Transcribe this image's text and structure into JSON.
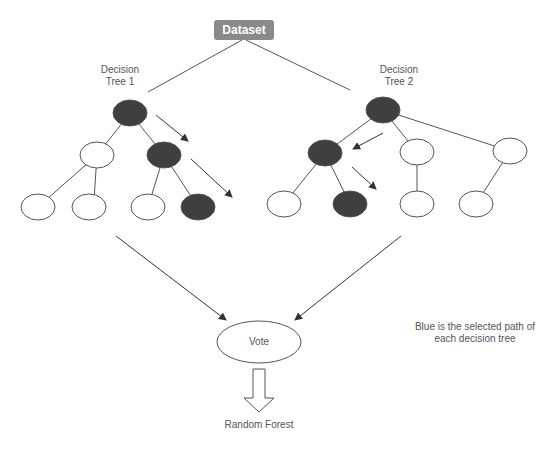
{
  "root": {
    "label": "Dataset",
    "fill": "#8a8a8a"
  },
  "trees": [
    {
      "label_line1": "Decision",
      "label_line2": "Tree 1",
      "nodes": [
        {
          "id": "t1-root",
          "x": 130,
          "y": 113,
          "selected": true
        },
        {
          "id": "t1-l",
          "x": 97,
          "y": 155,
          "selected": false
        },
        {
          "id": "t1-r",
          "x": 164,
          "y": 155,
          "selected": true
        },
        {
          "id": "t1-ll",
          "x": 38,
          "y": 207,
          "selected": false
        },
        {
          "id": "t1-lr",
          "x": 89,
          "y": 207,
          "selected": false
        },
        {
          "id": "t1-rl",
          "x": 148,
          "y": 207,
          "selected": false
        },
        {
          "id": "t1-rr",
          "x": 198,
          "y": 207,
          "selected": true
        }
      ]
    },
    {
      "label_line1": "Decision",
      "label_line2": "Tree 2",
      "nodes": [
        {
          "id": "t2-root",
          "x": 383,
          "y": 110,
          "selected": true
        },
        {
          "id": "t2-a",
          "x": 325,
          "y": 153,
          "selected": true
        },
        {
          "id": "t2-b",
          "x": 417,
          "y": 152,
          "selected": false
        },
        {
          "id": "t2-c",
          "x": 510,
          "y": 151,
          "selected": false
        },
        {
          "id": "t2-al",
          "x": 284,
          "y": 204,
          "selected": false
        },
        {
          "id": "t2-ar",
          "x": 350,
          "y": 204,
          "selected": true
        },
        {
          "id": "t2-bl",
          "x": 417,
          "y": 204,
          "selected": false
        },
        {
          "id": "t2-cl",
          "x": 476,
          "y": 204,
          "selected": false
        }
      ]
    }
  ],
  "vote": {
    "label": "Vote"
  },
  "output": {
    "label": "Random Forest"
  },
  "note": {
    "line1": "Blue is the selected path of",
    "line2": "each decision tree"
  },
  "colors": {
    "selected_node": "#3f3f3f",
    "node_stroke": "#555555",
    "edge": "#555555",
    "text": "#555555"
  }
}
